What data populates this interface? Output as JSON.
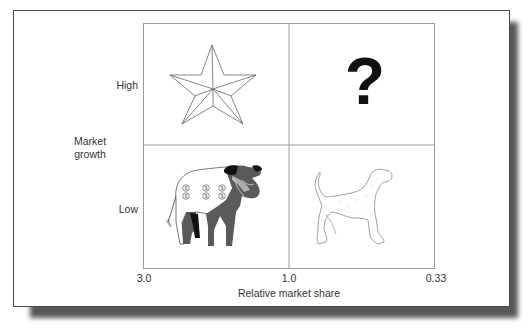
{
  "diagram": {
    "type": "growth-share-matrix",
    "y_axis": {
      "title": "Market\ngrowth",
      "title_line1": "Market",
      "title_line2": "growth",
      "ticks": [
        "High",
        "Low"
      ]
    },
    "x_axis": {
      "title": "Relative market share",
      "ticks": [
        "3.0",
        "1.0",
        "0.33"
      ]
    },
    "quadrants": [
      {
        "position": "top-left",
        "growth": "High",
        "share": "High",
        "icon": "star-icon"
      },
      {
        "position": "top-right",
        "growth": "High",
        "share": "Low",
        "icon": "question-mark-icon",
        "symbol": "?"
      },
      {
        "position": "bottom-left",
        "growth": "Low",
        "share": "High",
        "icon": "cash-cow-icon",
        "markings": "$ $ $"
      },
      {
        "position": "bottom-right",
        "growth": "Low",
        "share": "Low",
        "icon": "dog-icon"
      }
    ],
    "colors": {
      "frame": "#4a4a4a",
      "grid": "#9a9a9a",
      "cow_dark": "#5a5a5a",
      "text": "#333333"
    }
  }
}
